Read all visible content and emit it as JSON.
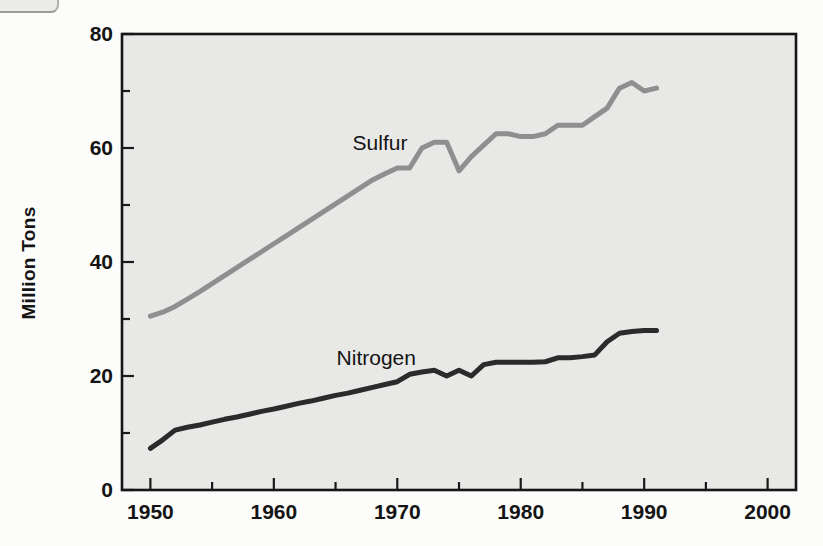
{
  "chart_data": {
    "type": "line",
    "title": "",
    "xlabel": "",
    "ylabel": "Million Tons",
    "xlim": [
      1947.7,
      2002.3
    ],
    "ylim": [
      0,
      80
    ],
    "x_major_ticks": [
      1950,
      1960,
      1970,
      1980,
      1990,
      2000
    ],
    "x_minor_ticks": [
      1955,
      1965,
      1975,
      1985,
      1995
    ],
    "y_major_ticks": [
      0,
      20,
      40,
      60,
      80
    ],
    "y_minor_ticks": [
      10,
      30,
      50,
      70
    ],
    "grid": false,
    "legend_position": "inline-labels",
    "plot_bg": "#eaeae8",
    "frame_color": "#161616",
    "x": [
      1950,
      1951,
      1952,
      1953,
      1954,
      1955,
      1956,
      1957,
      1958,
      1959,
      1960,
      1961,
      1962,
      1963,
      1964,
      1965,
      1966,
      1967,
      1968,
      1969,
      1970,
      1971,
      1972,
      1973,
      1974,
      1975,
      1976,
      1977,
      1978,
      1979,
      1980,
      1981,
      1982,
      1983,
      1984,
      1985,
      1986,
      1987,
      1988,
      1989,
      1990,
      1991
    ],
    "series": [
      {
        "name": "Sulfur",
        "color": "#8f8f8f",
        "label_pos": {
          "x": 1968.6,
          "y": 60.9
        },
        "values": [
          30.5,
          31.2,
          32.2,
          33.5,
          34.8,
          36.2,
          37.6,
          39.0,
          40.4,
          41.8,
          43.2,
          44.6,
          46.0,
          47.4,
          48.8,
          50.2,
          51.6,
          53.0,
          54.4,
          55.5,
          56.5,
          56.5,
          60.0,
          61.0,
          61.0,
          56.0,
          58.5,
          60.5,
          62.5,
          62.5,
          62.0,
          62.0,
          62.5,
          64.0,
          64.0,
          64.0,
          65.5,
          67.0,
          70.5,
          71.5,
          70.0,
          70.5
        ]
      },
      {
        "name": "Nitrogen",
        "color": "#2b2b2b",
        "label_pos": {
          "x": 1968.3,
          "y": 23.2
        },
        "values": [
          7.3,
          8.8,
          10.5,
          11.0,
          11.4,
          11.9,
          12.4,
          12.8,
          13.3,
          13.8,
          14.2,
          14.7,
          15.2,
          15.6,
          16.1,
          16.6,
          17.0,
          17.5,
          18.0,
          18.5,
          19.0,
          20.3,
          20.7,
          21.0,
          20.0,
          21.0,
          20.0,
          22.0,
          22.4,
          22.4,
          22.4,
          22.4,
          22.5,
          23.2,
          23.2,
          23.4,
          23.7,
          26.0,
          27.5,
          27.8,
          28.0,
          28.0
        ]
      }
    ]
  }
}
